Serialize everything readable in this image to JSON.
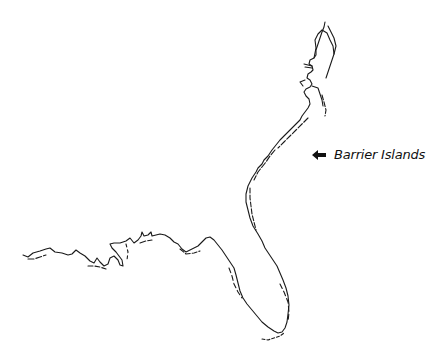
{
  "diagram": {
    "annotation": {
      "label": "Barrier Islands",
      "icon": "arrow-left-icon"
    },
    "colors": {
      "line": "#1a1a1a",
      "background": "#ffffff"
    }
  }
}
